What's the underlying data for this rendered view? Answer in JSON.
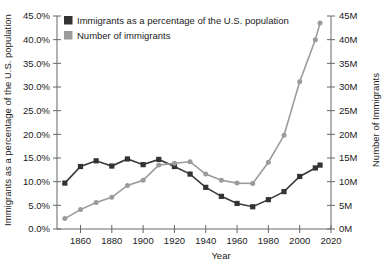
{
  "chart_data": {
    "type": "line",
    "title": "",
    "xlabel": "Year",
    "ylabel": "Immigrants as a percentage of the U.S. population",
    "y2label": "Number of Immigrants",
    "xlim": [
      1845,
      2020
    ],
    "ylim": [
      0,
      45
    ],
    "y2lim": [
      0,
      45
    ],
    "grid": false,
    "legend_position": "top-left",
    "x_ticks": [
      1860,
      1880,
      1900,
      1920,
      1940,
      1960,
      1980,
      2000,
      2020
    ],
    "x_tick_labels": [
      "1860",
      "1880",
      "1900",
      "1920",
      "1940",
      "1960",
      "1980",
      "2000",
      "2020"
    ],
    "y_ticks": [
      0,
      5,
      10,
      15,
      20,
      25,
      30,
      35,
      40,
      45
    ],
    "y_tick_labels": [
      "0.0%",
      "5.0%",
      "10.0%",
      "15.0%",
      "20.0%",
      "25.0%",
      "30.0%",
      "35.0%",
      "40.0%",
      "45.0%"
    ],
    "y2_ticks": [
      0,
      5,
      10,
      15,
      20,
      25,
      30,
      35,
      40,
      45
    ],
    "y2_tick_labels": [
      "0M",
      "5M",
      "10M",
      "15M",
      "20M",
      "25M",
      "30M",
      "35M",
      "40M",
      "45M"
    ],
    "x": [
      1850,
      1860,
      1870,
      1880,
      1890,
      1900,
      1910,
      1920,
      1930,
      1940,
      1950,
      1960,
      1970,
      1980,
      1990,
      2000,
      2010,
      2013
    ],
    "series": [
      {
        "name": "Immigrants as a percentage of the U.S. population",
        "axis": "left",
        "unit": "percent",
        "color": "#333333",
        "marker": "square",
        "values": [
          9.7,
          13.2,
          14.4,
          13.3,
          14.8,
          13.6,
          14.7,
          13.2,
          11.6,
          8.8,
          6.9,
          5.4,
          4.7,
          6.2,
          7.9,
          11.1,
          12.9,
          13.5
        ]
      },
      {
        "name": "Number of immigrants",
        "axis": "right",
        "unit": "millions",
        "color": "#9b9b9b",
        "marker": "circle",
        "values": [
          2.2,
          4.1,
          5.6,
          6.7,
          9.2,
          10.3,
          13.5,
          13.9,
          14.2,
          11.6,
          10.3,
          9.7,
          9.6,
          14.1,
          19.8,
          31.1,
          40.0,
          43.5
        ]
      }
    ],
    "legend": [
      {
        "label": "Immigrants as a percentage of the U.S. population",
        "color": "#333333"
      },
      {
        "label": "Number of immigrants",
        "color": "#9b9b9b"
      }
    ]
  }
}
